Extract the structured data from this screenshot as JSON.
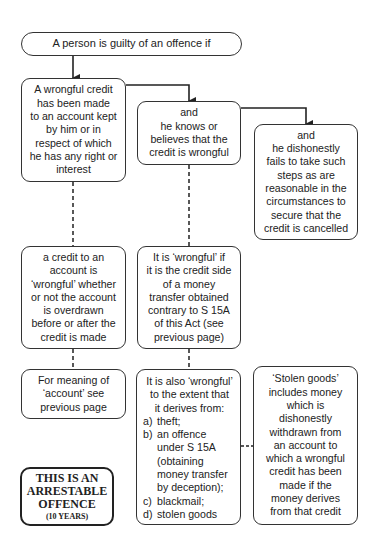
{
  "diagram": {
    "top": {
      "text": "A person is guilty of an offence if"
    },
    "row1": [
      {
        "id": "wrongful-credit",
        "lines": [
          "A wrongful credit",
          "has been made",
          "to an account kept",
          "by him or in",
          "respect of which",
          "he has any right or",
          "interest"
        ]
      },
      {
        "id": "knows-wrongful",
        "lines": [
          "and",
          "he knows or",
          "believes that the",
          "credit is wrongful"
        ]
      },
      {
        "id": "fails-to-cancel",
        "lines": [
          "and",
          "he dishonestly",
          "fails to take such",
          "steps as are",
          "reasonable in the",
          "circumstances to",
          "secure that the",
          "credit is cancelled"
        ]
      }
    ],
    "row2": [
      {
        "id": "overdrawn-note",
        "lines": [
          "a credit to an",
          "account is",
          "‘wrongful’ whether",
          "or not the account",
          "is overdrawn",
          "before or after the",
          "credit is made"
        ]
      },
      {
        "id": "s15a-note",
        "lines": [
          "It is ‘wrongful’ if",
          "it is the credit side",
          "of a money",
          "transfer obtained",
          "contrary to S 15A",
          "of this Act (see",
          "previous page)"
        ]
      }
    ],
    "row3": {
      "account_meaning": {
        "lines": [
          "For meaning of",
          "‘account’ see",
          "previous page"
        ]
      },
      "also_wrongful": {
        "head": [
          "It is also ‘wrongful’",
          "to the extent that",
          "it derives from:"
        ],
        "items": [
          {
            "label": "a)",
            "lines": [
              "theft;"
            ]
          },
          {
            "label": "b)",
            "lines": [
              "an offence",
              "under S 15A",
              "(obtaining",
              "money transfer",
              "by deception);"
            ]
          },
          {
            "label": "c)",
            "lines": [
              "blackmail;"
            ]
          },
          {
            "label": "d)",
            "lines": [
              "stolen goods"
            ]
          }
        ]
      },
      "stolen_goods": {
        "lines": [
          "‘Stolen goods’",
          "includes money",
          "which is",
          "dishonestly",
          "withdrawn from",
          "an account to",
          "which a wrongful",
          "credit has been",
          "made if the",
          "money derives",
          "from that credit"
        ]
      }
    },
    "arrestable": {
      "lines": [
        "THIS IS AN",
        "ARRESTABLE",
        "OFFENCE"
      ],
      "penalty": "(10 YEARS)"
    }
  },
  "colors": {
    "line": "#222222",
    "background": "#ffffff"
  }
}
